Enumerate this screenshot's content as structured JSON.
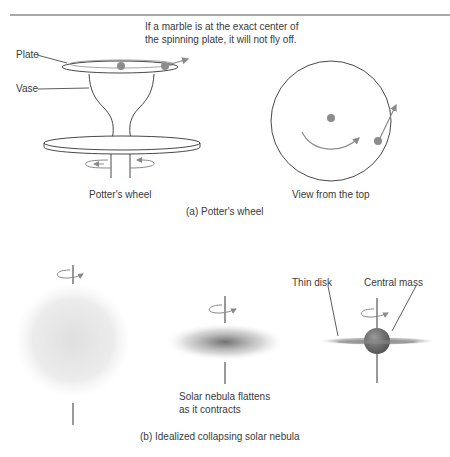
{
  "figure": {
    "part_a": {
      "annotation_line1": "If a marble is at the exact center of",
      "annotation_line2": "the spinning plate, it will not fly off.",
      "label_plate": "Plate",
      "label_vase": "Vase",
      "label_potters_wheel": "Potter's wheel",
      "label_view_top": "View from the top",
      "caption": "(a) Potter's wheel"
    },
    "part_b": {
      "label_thin_disk": "Thin disk",
      "label_central_mass": "Central mass",
      "label_flattens_line1": "Solar nebula flattens",
      "label_flattens_line2": "as it contracts",
      "caption": "(b) Idealized collapsing solar nebula"
    },
    "colors": {
      "line": "#333333",
      "marble": "#8c8c8c",
      "arrow": "#8a8a8a",
      "nebula": "#bdbdbd",
      "core": "#6e6e6e",
      "rule": "#555555"
    }
  }
}
